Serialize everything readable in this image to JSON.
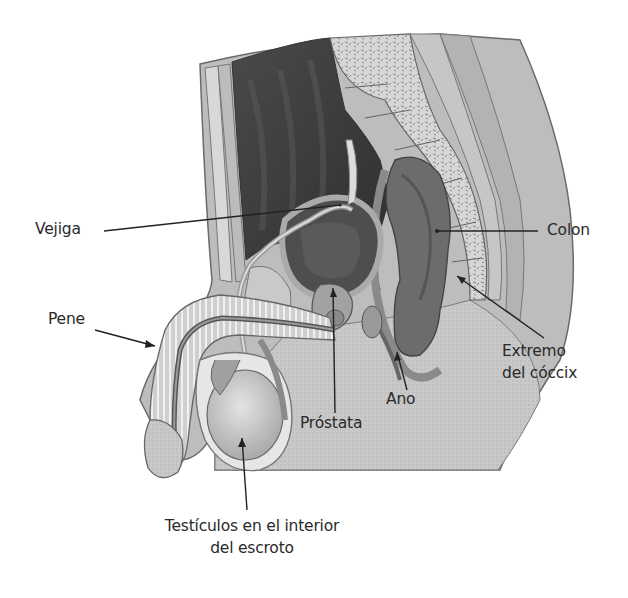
{
  "diagram": {
    "colors": {
      "background": "#ffffff",
      "skin": "#b9b9b9",
      "tissue_light": "#d9d9d9",
      "tissue_mid": "#9c9c9c",
      "cavity_dark": "#3c3c3c",
      "label_text": "#2a2a2a",
      "leader_line": "#222222"
    },
    "labels": {
      "vejiga": "Vejiga",
      "pene": "Pene",
      "colon": "Colon",
      "extremo_line1": "Extremo",
      "extremo_line2": "del cóccix",
      "ano": "Ano",
      "prostata": "Próstata",
      "testiculos_line1": "Testículos en el interior",
      "testiculos_line2": "del escroto"
    }
  }
}
